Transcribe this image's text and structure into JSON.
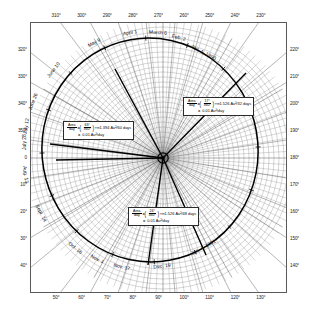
{
  "figure": {
    "type": "polar-orbit-diagram",
    "title": "",
    "background": "#ffffff",
    "frame_color": "#5a5a5a",
    "orbit_color": "#000000",
    "grid_color": "#6b6b6b"
  },
  "axes": {
    "top_ticks": [
      "310°",
      "300°",
      "290°",
      "280°",
      "270°",
      "260°",
      "250°",
      "240°",
      "230°"
    ],
    "bottom_ticks": [
      "50°",
      "60°",
      "70°",
      "80°",
      "90°",
      "100°",
      "110°",
      "120°",
      "130°"
    ],
    "left_ticks": [
      "320°",
      "330°",
      "340°",
      "350°",
      "0",
      "10°",
      "20°",
      "30°",
      "40°"
    ],
    "right_ticks": [
      "220°",
      "210°",
      "200°",
      "190°",
      "180°",
      "170°",
      "160°",
      "150°",
      "140°"
    ]
  },
  "date_labels": [
    {
      "text": "Jan. 1, 1990",
      "angle_deg": -62
    },
    {
      "text": "Feb. 2",
      "angle_deg": -76
    },
    {
      "text": "March 6",
      "angle_deg": -86
    },
    {
      "text": "April 1",
      "angle_deg": -100
    },
    {
      "text": "May 9",
      "angle_deg": -118
    },
    {
      "text": "June 10",
      "angle_deg": -142
    },
    {
      "text": "June 26",
      "angle_deg": -160
    },
    {
      "text": "July 12",
      "angle_deg": -172
    },
    {
      "text": "July 28",
      "angle_deg": -180
    },
    {
      "text": "Aug. 13",
      "angle_deg": 172
    },
    {
      "text": "Sept. 14",
      "angle_deg": 152
    },
    {
      "text": "Oct. 16",
      "angle_deg": 128
    },
    {
      "text": "Nov. 1",
      "angle_deg": 116
    },
    {
      "text": "Nov. 17",
      "angle_deg": 104
    },
    {
      "text": "Dec. 19",
      "angle_deg": 84
    },
    {
      "text": "Jan. 4, 1991",
      "angle_deg": 62
    }
  ],
  "annotations": [
    {
      "id": "sector-upper-right",
      "numerator": "17°",
      "denominator": "360°",
      "prefix_num": "Area",
      "prefix_den": "day",
      "equals": "=",
      "tail": "×π1.526 Au²/32 days",
      "result_prefix": "=",
      "result": "0.01 Au²/day"
    },
    {
      "id": "sector-left",
      "numerator": "63°",
      "denominator": "360°",
      "prefix_num": "Area",
      "prefix_den": "day",
      "equals": "=",
      "tail": "×π1.394 Au²/60 days",
      "result_prefix": "=",
      "result": "0.01 Au²/day"
    },
    {
      "id": "sector-lower",
      "numerator": "24°",
      "denominator": "360°",
      "prefix_num": "Area",
      "prefix_den": "day",
      "equals": "=",
      "tail": "×π1.526 Au²/48 days",
      "result_prefix": "=",
      "result": "0.01 Au²/day"
    }
  ],
  "chart_data": {
    "type": "line",
    "subtype": "polar",
    "title": "",
    "xlabel": "",
    "ylabel": "",
    "theta_unit": "degrees",
    "r_unit": "AU",
    "grid": true,
    "legend": "none",
    "theta_range": [
      0,
      360
    ],
    "r_range": [
      0,
      1.6
    ],
    "sun_position": {
      "r": 0,
      "theta": 0,
      "label": "Sun (focus)"
    },
    "series": [
      {
        "name": "Comet orbit (ellipse)",
        "theta": [
          180,
          190,
          200,
          210,
          220,
          230,
          240,
          250,
          260,
          270,
          280,
          290,
          300,
          310,
          320,
          330,
          340,
          350,
          0,
          10,
          20,
          30,
          40,
          50,
          60,
          70,
          80,
          90,
          100,
          110,
          120,
          130,
          140,
          150,
          160,
          170,
          180
        ],
        "r": [
          1.52,
          1.52,
          1.51,
          1.5,
          1.48,
          1.45,
          1.42,
          1.38,
          1.33,
          1.28,
          1.22,
          1.16,
          1.09,
          1.02,
          0.95,
          0.88,
          0.81,
          0.75,
          0.7,
          0.66,
          0.63,
          0.62,
          0.62,
          0.64,
          0.68,
          0.74,
          0.81,
          0.89,
          0.98,
          1.07,
          1.16,
          1.25,
          1.33,
          1.4,
          1.46,
          1.5,
          1.52
        ]
      }
    ],
    "swept_sectors": [
      {
        "label": "Jan. 1, 1990 – Feb. 2",
        "days": 32,
        "sector_angle_deg": 17,
        "area_au2": 0.32,
        "area_per_day": 0.01
      },
      {
        "label": "July 28 sector",
        "days": 60,
        "sector_angle_deg": 63,
        "area_au2": 0.6,
        "area_per_day": 0.01
      },
      {
        "label": "Nov. 17 – Jan. 4, 1991",
        "days": 48,
        "sector_angle_deg": 24,
        "area_au2": 0.48,
        "area_per_day": 0.01
      }
    ],
    "tick_dates": [
      "Jan. 1, 1990",
      "Feb. 2",
      "March 6",
      "April 1",
      "May 9",
      "June 10",
      "June 26",
      "July 12",
      "July 28",
      "Aug. 13",
      "Sept. 14",
      "Oct. 16",
      "Nov. 1",
      "Nov. 17",
      "Dec. 19",
      "Jan. 4, 1991"
    ],
    "angular_ticks_top": [
      310,
      300,
      290,
      280,
      270,
      260,
      250,
      240,
      230
    ],
    "angular_ticks_bottom": [
      50,
      60,
      70,
      80,
      90,
      100,
      110,
      120,
      130
    ],
    "angular_ticks_left": [
      320,
      330,
      340,
      350,
      0,
      10,
      20,
      30,
      40
    ],
    "angular_ticks_right": [
      220,
      210,
      200,
      190,
      180,
      170,
      160,
      150,
      140
    ]
  }
}
